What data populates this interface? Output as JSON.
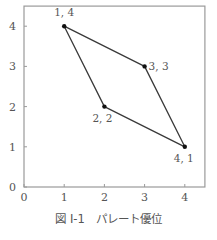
{
  "caption": "図 I-1　パレート優位",
  "colors": {
    "frame": "#9a9a9a",
    "line": "#3a3a3a",
    "point": "#111111",
    "text": "#555555"
  },
  "chart_data": {
    "type": "line",
    "title": "図 I-1　パレート優位",
    "xlabel": "",
    "ylabel": "",
    "xlim": [
      0,
      4.5
    ],
    "ylim": [
      0,
      4.5
    ],
    "xticks": [
      0,
      1,
      2,
      3,
      4
    ],
    "yticks": [
      0,
      1,
      2,
      3,
      4
    ],
    "grid": false,
    "legend": null,
    "series": [
      {
        "name": "polygon",
        "closed": true,
        "points": [
          {
            "x": 1,
            "y": 4,
            "label": "1, 4"
          },
          {
            "x": 3,
            "y": 3,
            "label": "3, 3"
          },
          {
            "x": 4,
            "y": 1,
            "label": "4, 1"
          },
          {
            "x": 2,
            "y": 2,
            "label": "2, 2"
          }
        ]
      }
    ]
  }
}
